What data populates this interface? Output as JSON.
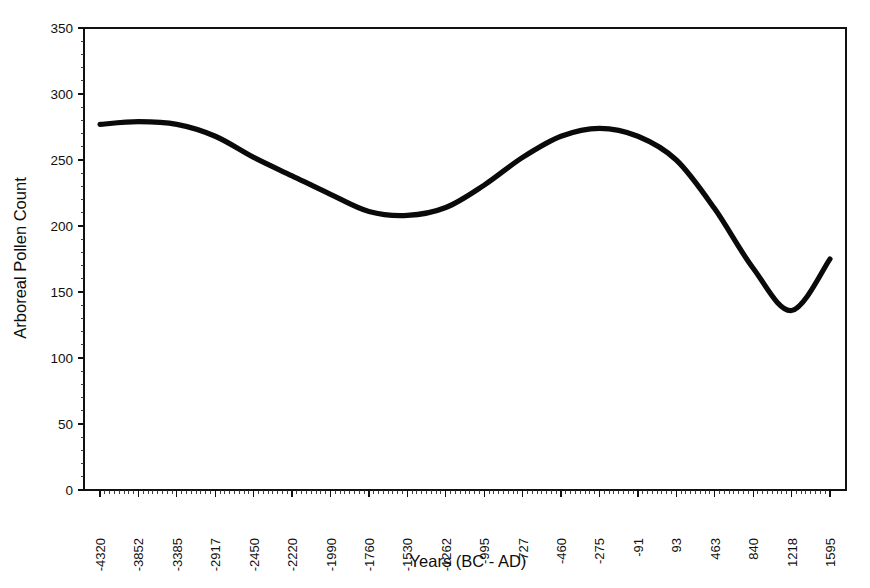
{
  "chart_data": {
    "type": "line",
    "title": "",
    "xlabel": "Years (BC - AD)",
    "ylabel": "Arboreal Pollen Count",
    "grid": false,
    "legend": "none",
    "ylim": [
      0,
      350
    ],
    "yticks": [
      0,
      50,
      100,
      150,
      200,
      250,
      300,
      350
    ],
    "ytick_labels": [
      "0",
      "50",
      "100",
      "150",
      "200",
      "250",
      "300",
      "350"
    ],
    "categories": [
      "-4320",
      "-3852",
      "-3385",
      "-2917",
      "-2450",
      "-2220",
      "-1990",
      "-1760",
      "-1530",
      "-1262",
      "-995",
      "-727",
      "-460",
      "-275",
      "-91",
      "93",
      "463",
      "840",
      "1218",
      "1595"
    ],
    "series": [
      {
        "name": "Arboreal Pollen Count",
        "color": "#0a0a0a",
        "values": [
          277,
          279,
          277,
          268,
          252,
          238,
          224,
          211,
          208,
          214,
          231,
          252,
          268,
          274,
          268,
          250,
          213,
          168,
          136,
          175
        ]
      }
    ],
    "annotations": []
  },
  "axes": {
    "y_axis_title": "Arboreal Pollen Count",
    "x_axis_title": "Years (BC - AD)",
    "y_max_label": "350",
    "y_min_label": "0"
  }
}
